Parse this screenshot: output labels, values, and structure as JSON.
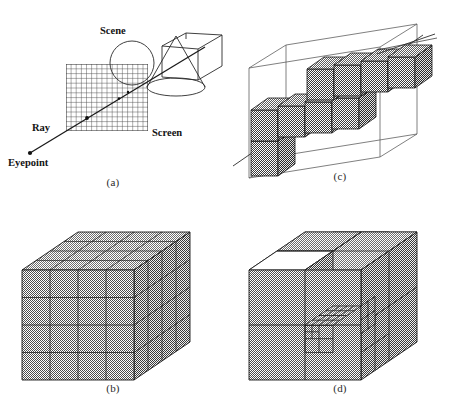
{
  "figure": {
    "background_color": "#ffffff",
    "ink_color": "#1a1a1a",
    "shade_color": "#8c8c8c",
    "panels": [
      {
        "id": "a",
        "caption": "(a)",
        "description": "Ray from eyepoint through screen pixel grid into the scene",
        "labels": {
          "scene": "Scene",
          "screen": "Screen",
          "ray": "Ray",
          "eyepoint": "Eyepoint"
        },
        "screen_grid": {
          "cols": 16,
          "rows": 14
        },
        "scene_objects": [
          "sphere",
          "cone",
          "box"
        ]
      },
      {
        "id": "b",
        "caption": "(b)",
        "description": "Uniform spatial subdivision of the scene volume into a regular voxel grid",
        "grid": {
          "x": 4,
          "y": 4,
          "z": 4
        }
      },
      {
        "id": "c",
        "caption": "(c)",
        "description": "Voxels pierced by a ray traversing the uniform grid bounding volume",
        "voxels_traversed": 9
      },
      {
        "id": "d",
        "caption": "(d)",
        "description": "Adaptive octree subdivision with one empty octant and one recursively refined region",
        "empty_octants": 1,
        "max_depth": 3
      }
    ]
  }
}
